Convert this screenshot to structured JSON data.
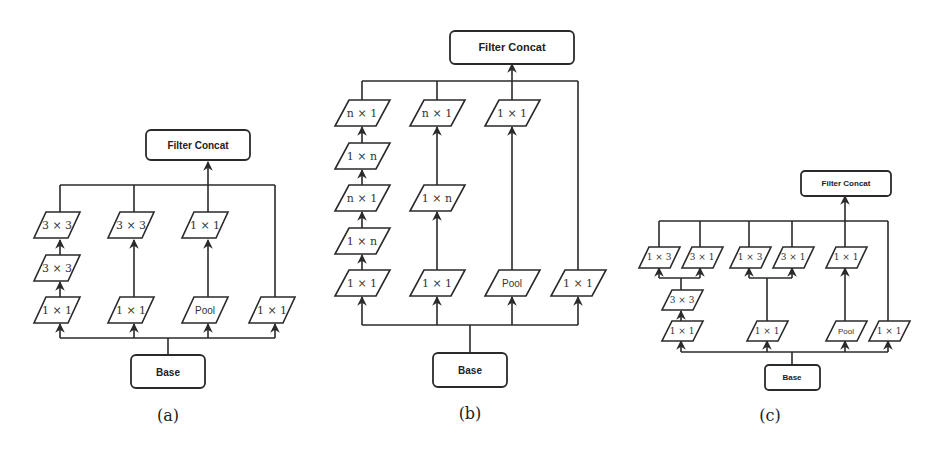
{
  "figure": {
    "panels": [
      {
        "id": "a",
        "caption": "(a)",
        "top": "Filter Concat",
        "bottom": "Base",
        "branches": [
          {
            "nodes": [
              "1 × 1",
              "3 × 3",
              "3 × 3"
            ]
          },
          {
            "nodes": [
              "1 × 1",
              "3 × 3"
            ]
          },
          {
            "nodes": [
              "Pool",
              "1 × 1"
            ]
          },
          {
            "nodes": [
              "1 × 1"
            ]
          }
        ]
      },
      {
        "id": "b",
        "caption": "(b)",
        "top": "Filter Concat",
        "bottom": "Base",
        "branches": [
          {
            "nodes": [
              "1 × 1",
              "1 × n",
              "n × 1",
              "1 × n",
              "n × 1"
            ]
          },
          {
            "nodes": [
              "1 × 1",
              "1 × n",
              "n × 1"
            ]
          },
          {
            "nodes": [
              "Pool",
              "1 × 1"
            ]
          },
          {
            "nodes": [
              "1 × 1"
            ]
          }
        ]
      },
      {
        "id": "c",
        "caption": "(c)",
        "top": "Filter Concat",
        "bottom": "Base",
        "branches": [
          {
            "nodes": [
              "1 × 1",
              "3 × 3"
            ],
            "split": [
              "1 × 3",
              "3 × 1"
            ]
          },
          {
            "nodes": [
              "1 × 1"
            ],
            "split": [
              "1 × 3",
              "3 × 1"
            ]
          },
          {
            "nodes": [
              "Pool",
              "1 × 1"
            ]
          },
          {
            "nodes": [
              "1 × 1"
            ]
          }
        ]
      }
    ]
  }
}
